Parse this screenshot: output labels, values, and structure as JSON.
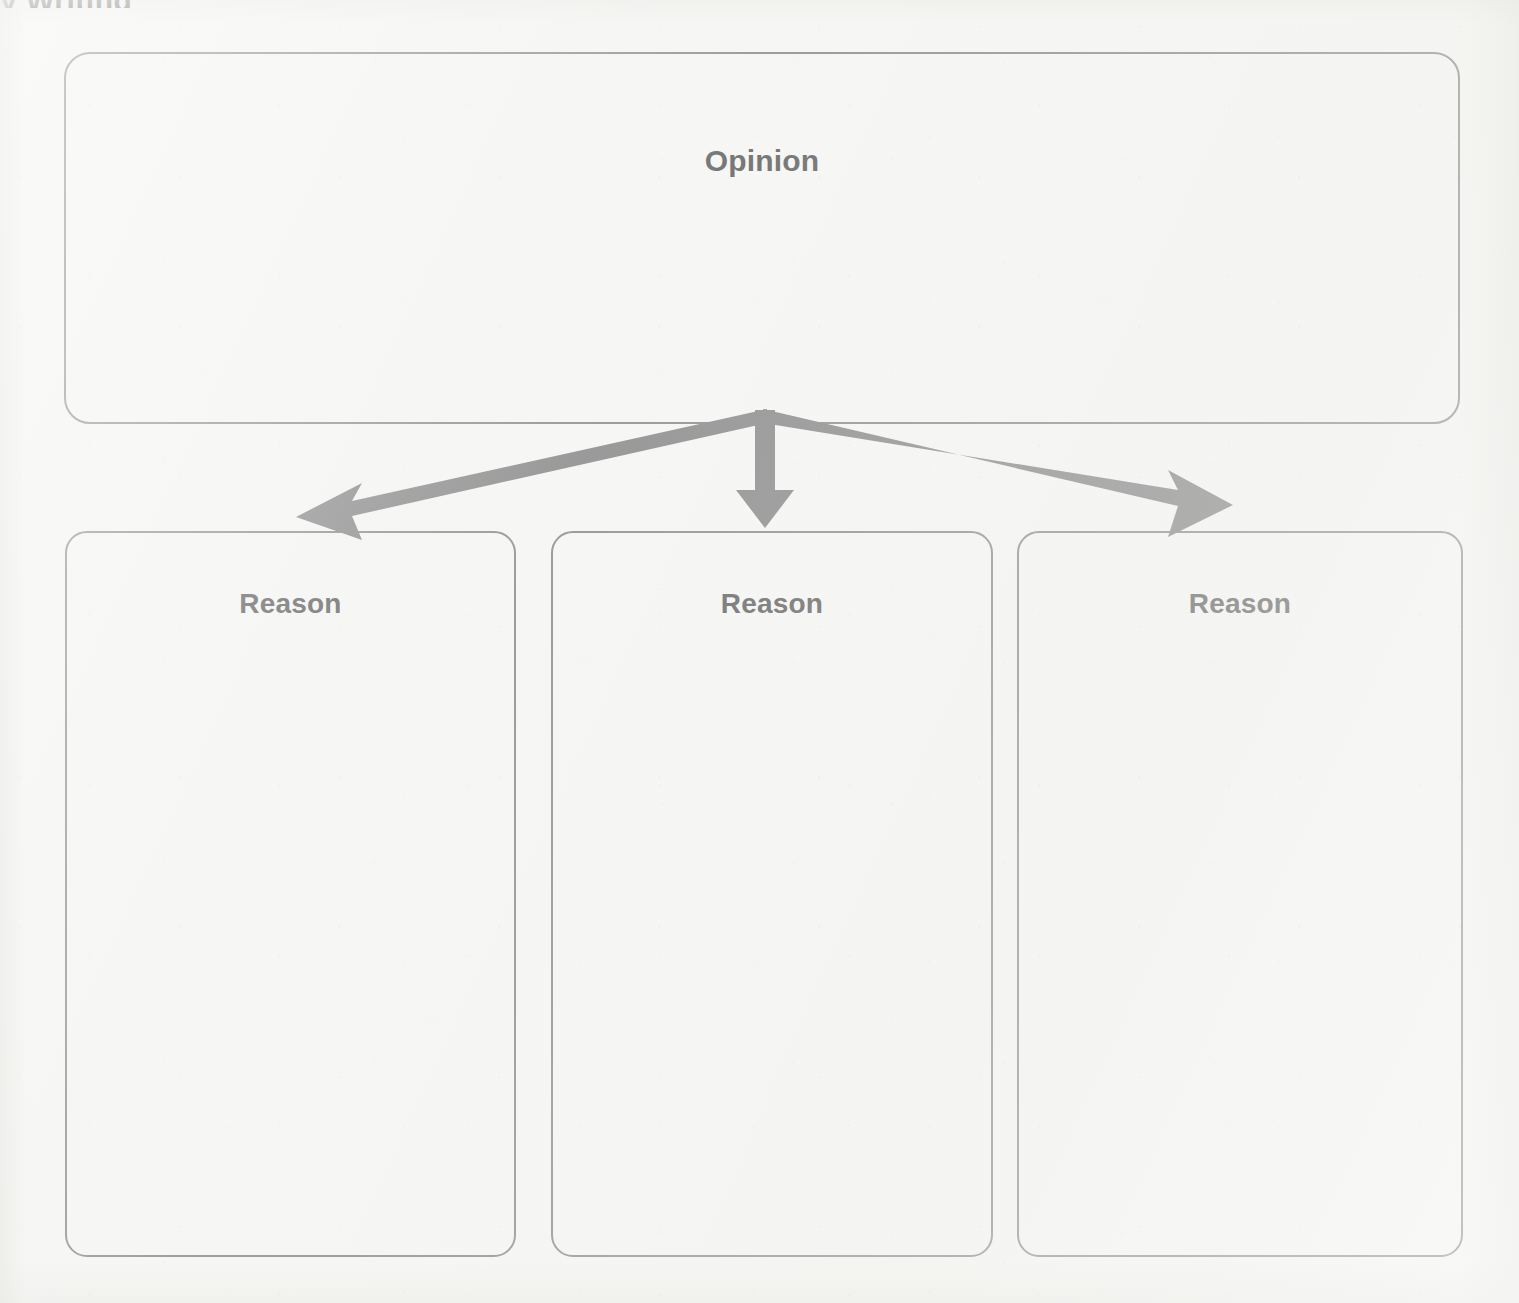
{
  "page": {
    "width": 1519,
    "height": 1303,
    "background_color": "#f6f6f4",
    "cropped_top_text": "y Writing"
  },
  "colors": {
    "box_border": "#9d9d9d",
    "label_text": "#787878",
    "arrow": "#9a9a9a",
    "paper": "#f6f6f4"
  },
  "organizer": {
    "title_box": {
      "label": "Opinion",
      "name": "opinion-box"
    },
    "reason_boxes": [
      {
        "label": "Reason",
        "name": "reason-box-1"
      },
      {
        "label": "Reason",
        "name": "reason-box-2"
      },
      {
        "label": "Reason",
        "name": "reason-box-3"
      }
    ],
    "arrows": [
      {
        "name": "arrow-to-reason-1",
        "direction": "down-left",
        "from": [
          765,
          412
        ],
        "to": [
          296,
          517
        ]
      },
      {
        "name": "arrow-to-reason-2",
        "direction": "down",
        "from": [
          765,
          412
        ],
        "to": [
          765,
          528
        ]
      },
      {
        "name": "arrow-to-reason-3",
        "direction": "down-right",
        "from": [
          765,
          412
        ],
        "to": [
          1233,
          505
        ]
      }
    ]
  }
}
